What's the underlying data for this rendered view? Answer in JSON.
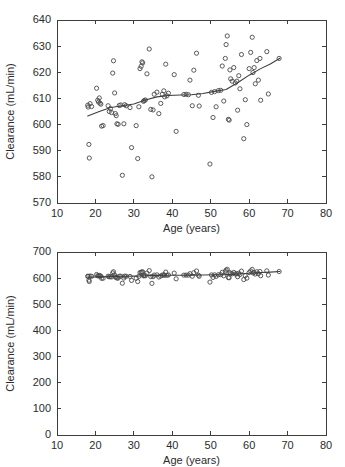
{
  "figure": {
    "title": "",
    "panel_labels": [
      "",
      ""
    ]
  },
  "chart_data": [
    {
      "type": "scatter",
      "panel": "top",
      "title": "",
      "xlabel": "Age (years)",
      "ylabel": "Clearance (mL/min)",
      "xlim": [
        10,
        80
      ],
      "ylim": [
        570,
        640
      ],
      "xticks": [
        10,
        20,
        30,
        40,
        50,
        60,
        70,
        80
      ],
      "yticks": [
        570,
        580,
        590,
        600,
        610,
        620,
        630,
        640
      ],
      "grid": false,
      "legend": null,
      "marker": "open-circle",
      "series": [
        {
          "name": "observed-clearance",
          "x": [
            18.0,
            18.1,
            18.3,
            18.4,
            18.6,
            19.0,
            20.3,
            20.6,
            20.8,
            21.0,
            21.2,
            21.4,
            21.6,
            22.0,
            23.3,
            23.6,
            23.9,
            24.2,
            24.5,
            24.7,
            25.0,
            25.2,
            25.4,
            25.6,
            25.9,
            26.2,
            26.6,
            27.0,
            27.4,
            27.6,
            28.0,
            29.0,
            29.4,
            30.6,
            31.0,
            31.3,
            31.6,
            31.9,
            32.1,
            32.3,
            32.5,
            32.7,
            33.0,
            33.4,
            34.0,
            34.4,
            34.7,
            35.0,
            35.3,
            36.0,
            36.5,
            37.0,
            37.4,
            37.8,
            38.0,
            38.3,
            38.6,
            39.0,
            40.5,
            41.0,
            43.0,
            43.6,
            44.2,
            44.6,
            45.2,
            45.6,
            46.3,
            46.8,
            47.0,
            49.8,
            50.2,
            50.6,
            51.0,
            51.4,
            52.0,
            52.6,
            53.0,
            53.4,
            53.8,
            54.0,
            54.3,
            54.6,
            54.8,
            55.0,
            55.2,
            55.6,
            56.0,
            56.4,
            56.8,
            57.0,
            57.3,
            57.6,
            58.0,
            58.6,
            59.0,
            59.4,
            60.0,
            60.4,
            60.8,
            61.0,
            61.3,
            61.6,
            62.0,
            62.4,
            62.8,
            63.0,
            64.6,
            65.0,
            67.8
          ],
          "y": [
            607.4,
            606.7,
            592.4,
            587.2,
            608.0,
            606.9,
            613.9,
            609.3,
            608.6,
            610.2,
            608.2,
            607.8,
            599.4,
            599.6,
            607.2,
            605.0,
            606.1,
            604.6,
            619.7,
            624.4,
            612.1,
            604.2,
            603.4,
            600.3,
            600.1,
            607.3,
            607.5,
            580.6,
            600.3,
            607.6,
            607.2,
            606.5,
            591.2,
            599.6,
            587.0,
            606.8,
            621.4,
            622.3,
            624.0,
            623.6,
            608.9,
            609.2,
            609.4,
            619.4,
            628.9,
            605.8,
            580.0,
            605.6,
            611.6,
            612.4,
            604.2,
            608.1,
            611.6,
            612.9,
            610.6,
            623.1,
            611.0,
            612.0,
            619.1,
            597.4,
            611.5,
            611.6,
            611.4,
            617.0,
            607.2,
            620.8,
            627.3,
            611.2,
            607.1,
            584.9,
            612.3,
            602.7,
            612.6,
            606.8,
            613.0,
            613.1,
            622.4,
            609.0,
            625.3,
            630.6,
            633.9,
            602.0,
            601.7,
            620.9,
            617.5,
            616.6,
            621.8,
            615.9,
            616.6,
            605.5,
            618.7,
            613.7,
            626.8,
            594.6,
            609.5,
            600.0,
            621.4,
            627.6,
            633.4,
            619.9,
            621.8,
            615.6,
            624.5,
            617.0,
            625.3,
            609.3,
            627.9,
            611.7,
            625.3
          ]
        }
      ],
      "trend_line": {
        "name": "smoothed-trend",
        "x": [
          18.0,
          21.0,
          24.0,
          27.0,
          30.0,
          33.0,
          36.0,
          39.0,
          42.0,
          45.0,
          48.0,
          51.0,
          54.0,
          57.0,
          60.0,
          63.0,
          65.5,
          68.0
        ],
        "y": [
          603.3,
          605.0,
          606.5,
          607.2,
          607.9,
          609.4,
          610.6,
          611.1,
          611.3,
          611.4,
          611.9,
          612.7,
          613.4,
          616.0,
          618.9,
          621.4,
          623.2,
          625.4
        ]
      }
    },
    {
      "type": "scatter",
      "panel": "bottom",
      "title": "",
      "xlabel": "Age (years)",
      "ylabel": "Clearance (mL/min)",
      "xlim": [
        10,
        80
      ],
      "ylim": [
        0,
        700
      ],
      "xticks": [
        10,
        20,
        30,
        40,
        50,
        60,
        70,
        80
      ],
      "yticks": [
        0,
        100,
        200,
        300,
        400,
        500,
        600,
        700
      ],
      "grid": false,
      "legend": null,
      "marker": "open-circle",
      "series": [
        {
          "name": "observed-clearance",
          "x": [
            18.0,
            18.1,
            18.3,
            18.4,
            18.6,
            19.0,
            20.3,
            20.6,
            20.8,
            21.0,
            21.2,
            21.4,
            21.6,
            22.0,
            23.3,
            23.6,
            23.9,
            24.2,
            24.5,
            24.7,
            25.0,
            25.2,
            25.4,
            25.6,
            25.9,
            26.2,
            26.6,
            27.0,
            27.4,
            27.6,
            28.0,
            29.0,
            29.4,
            30.6,
            31.0,
            31.3,
            31.6,
            31.9,
            32.1,
            32.3,
            32.5,
            32.7,
            33.0,
            33.4,
            34.0,
            34.4,
            34.7,
            35.0,
            35.3,
            36.0,
            36.5,
            37.0,
            37.4,
            37.8,
            38.0,
            38.3,
            38.6,
            39.0,
            40.5,
            41.0,
            43.0,
            43.6,
            44.2,
            44.6,
            45.2,
            45.6,
            46.3,
            46.8,
            47.0,
            49.8,
            50.2,
            50.6,
            51.0,
            51.4,
            52.0,
            52.6,
            53.0,
            53.4,
            53.8,
            54.0,
            54.3,
            54.6,
            54.8,
            55.0,
            55.2,
            55.6,
            56.0,
            56.4,
            56.8,
            57.0,
            57.3,
            57.6,
            58.0,
            58.6,
            59.0,
            59.4,
            60.0,
            60.4,
            60.8,
            61.0,
            61.3,
            61.6,
            62.0,
            62.4,
            62.8,
            63.0,
            64.6,
            65.0,
            67.8
          ],
          "y": [
            607.4,
            606.7,
            592.4,
            587.2,
            608.0,
            606.9,
            613.9,
            609.3,
            608.6,
            610.2,
            608.2,
            607.8,
            599.4,
            599.6,
            607.2,
            605.0,
            606.1,
            604.6,
            619.7,
            624.4,
            612.1,
            604.2,
            603.4,
            600.3,
            600.1,
            607.3,
            607.5,
            580.6,
            600.3,
            607.6,
            607.2,
            606.5,
            591.2,
            599.6,
            587.0,
            606.8,
            621.4,
            622.3,
            624.0,
            623.6,
            608.9,
            609.2,
            609.4,
            619.4,
            628.9,
            605.8,
            580.0,
            605.6,
            611.6,
            612.4,
            604.2,
            608.1,
            611.6,
            612.9,
            610.6,
            623.1,
            611.0,
            612.0,
            619.1,
            597.4,
            611.5,
            611.6,
            611.4,
            617.0,
            607.2,
            620.8,
            627.3,
            611.2,
            607.1,
            584.9,
            612.3,
            602.7,
            612.6,
            606.8,
            613.0,
            613.1,
            622.4,
            609.0,
            625.3,
            630.6,
            633.9,
            602.0,
            601.7,
            620.9,
            617.5,
            616.6,
            621.8,
            615.9,
            616.6,
            605.5,
            618.7,
            613.7,
            626.8,
            594.6,
            609.5,
            600.0,
            621.4,
            627.6,
            633.4,
            619.9,
            621.8,
            615.6,
            624.5,
            617.0,
            625.3,
            609.3,
            627.9,
            611.7,
            625.3
          ]
        }
      ],
      "trend_line": {
        "name": "smoothed-trend",
        "x": [
          18.0,
          21.0,
          24.0,
          27.0,
          30.0,
          33.0,
          36.0,
          39.0,
          42.0,
          45.0,
          48.0,
          51.0,
          54.0,
          57.0,
          60.0,
          63.0,
          65.5,
          68.0
        ],
        "y": [
          603.3,
          605.0,
          606.5,
          607.2,
          607.9,
          609.4,
          610.6,
          611.1,
          611.3,
          611.4,
          611.9,
          612.7,
          613.4,
          616.0,
          618.9,
          621.4,
          623.2,
          625.4
        ]
      }
    }
  ],
  "colors": {
    "axis": "#3d3d3d",
    "marker": "#4a4a4a",
    "trend": "#3d3d3d",
    "background": "#ffffff"
  }
}
